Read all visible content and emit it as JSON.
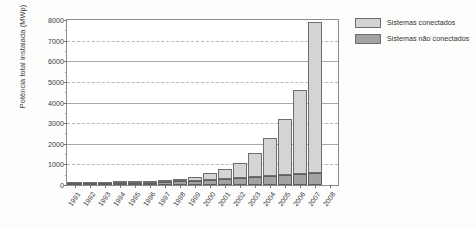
{
  "chart_data": {
    "type": "bar",
    "stacked": true,
    "title": "",
    "xlabel": "",
    "ylabel": "Potência total instalada (MWp)",
    "ylim": [
      0,
      8000
    ],
    "ytick_step": 1000,
    "yticks": [
      "0",
      "1000",
      "2000",
      "3000",
      "4000",
      "5000",
      "6000",
      "7000",
      "8000"
    ],
    "grid": true,
    "legend_position": "right",
    "categories": [
      "1991",
      "1992",
      "1993",
      "1994",
      "1995",
      "1996",
      "1997",
      "1998",
      "1999",
      "2000",
      "2001",
      "2002",
      "2003",
      "2004",
      "2005",
      "2006",
      "2007",
      "2008"
    ],
    "series": [
      {
        "name": "Sistemas conectados",
        "color": "#d4d4d4",
        "values": [
          5,
          10,
          18,
          28,
          42,
          60,
          85,
          125,
          200,
          320,
          500,
          760,
          1180,
          1850,
          2700,
          4100,
          7300,
          0
        ]
      },
      {
        "name": "Sistemas não conectados",
        "color": "#a3a3a3",
        "values": [
          45,
          55,
          70,
          85,
          100,
          120,
          145,
          175,
          210,
          250,
          290,
          330,
          380,
          430,
          480,
          530,
          580,
          0
        ]
      }
    ],
    "totals": [
      50,
      65,
      88,
      113,
      142,
      180,
      230,
      300,
      410,
      570,
      790,
      1090,
      1560,
      2280,
      3180,
      4630,
      7880,
      0
    ]
  },
  "legend": {
    "items": [
      {
        "label": "Sistemas conectados",
        "swatch": "light-gray"
      },
      {
        "label": "Sistemas não conectados",
        "swatch": "dark-gray"
      }
    ]
  }
}
